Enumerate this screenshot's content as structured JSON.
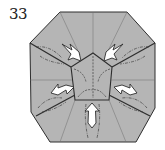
{
  "diagram": {
    "step_number": "33",
    "colors": {
      "paper": "#b5b5b5",
      "outline": "#2e2e2e",
      "crease": "#6f6f6f",
      "arrow_fill": "#ffffff",
      "background": "#ffffff"
    },
    "shapes": {
      "outer_octagon": "60,12 127,12 155,43 155,108 136,142 50,142 31,112 30,43",
      "center_pentagon": "93,53 112,67 109,100 75,100 71,67"
    },
    "arrows": [
      {
        "name": "arrow-upper-left",
        "direction": "down-right"
      },
      {
        "name": "arrow-upper-right",
        "direction": "down-left"
      },
      {
        "name": "arrow-left",
        "direction": "right"
      },
      {
        "name": "arrow-right",
        "direction": "left"
      },
      {
        "name": "arrow-bottom",
        "direction": "up"
      }
    ]
  }
}
